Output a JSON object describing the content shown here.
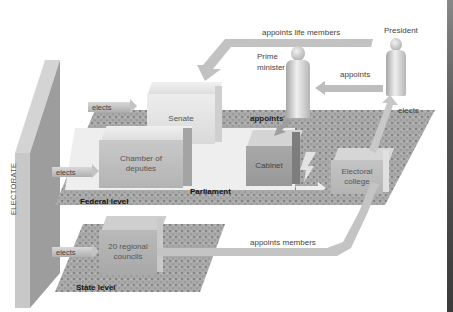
{
  "diagram": {
    "title": "",
    "nodes": {
      "electorate": "ELECTORATE",
      "senate": "Senate",
      "chamber": "Chamber of deputies",
      "chamber_line1": "Chamber of",
      "chamber_line2": "deputies",
      "cabinet": "Cabinet",
      "electoral_college": "Electoral college",
      "electoral_line1": "Electoral",
      "electoral_line2": "college",
      "regional": "20 regional councils",
      "regional_line1": "20 regional",
      "regional_line2": "councils",
      "prime_minister": "Prime minister",
      "pm_line1": "Prime",
      "pm_line2": "minister",
      "president": "President"
    },
    "levels": {
      "parliament": "Parliament",
      "federal": "Federal level",
      "state": "State level"
    },
    "edges": [
      {
        "from": "electorate",
        "to": "senate",
        "label": "elects"
      },
      {
        "from": "electorate",
        "to": "chamber",
        "label": "elects"
      },
      {
        "from": "electorate",
        "to": "regional",
        "label": "elects"
      },
      {
        "from": "president",
        "to": "senate",
        "label": "appoints life members"
      },
      {
        "from": "president",
        "to": "prime_minister",
        "label": "appoints"
      },
      {
        "from": "prime_minister",
        "to": "cabinet",
        "label": "appoints"
      },
      {
        "from": "electoral_college",
        "to": "president",
        "label": "elects"
      },
      {
        "from": "regional",
        "to": "electoral_college",
        "label": "appoints members"
      },
      {
        "from": "parliament",
        "to": "electoral_college",
        "label": ""
      }
    ]
  },
  "colors": {
    "background": "#ffffff",
    "box": "#bdbdbd",
    "ground": "#a8a8a8",
    "text": "#444444"
  }
}
